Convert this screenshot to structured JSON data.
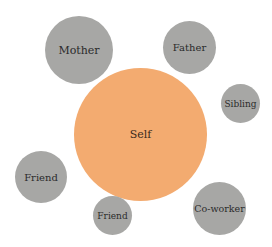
{
  "diagram": {
    "type": "social-network-bubble",
    "colors": {
      "self": "#f3ab70",
      "other": "#a7a7a5",
      "label": "#2b2b2b",
      "background": "#ffffff"
    },
    "center": {
      "label": "Self"
    },
    "nodes": [
      {
        "label": "Mother"
      },
      {
        "label": "Father"
      },
      {
        "label": "Sibling"
      },
      {
        "label": "Friend"
      },
      {
        "label": "Friend"
      },
      {
        "label": "Co-worker"
      }
    ]
  }
}
